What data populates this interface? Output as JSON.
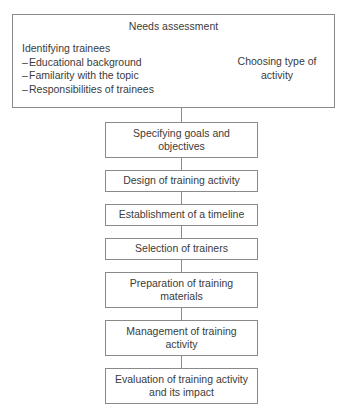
{
  "diagram": {
    "title": "Needs assessment",
    "header": {
      "title": "Needs assessment",
      "left_column": {
        "heading": "Identifying trainees",
        "items": [
          "Educational background",
          "Familarity with the topic",
          "Responsibilities of trainees"
        ],
        "bullet_marker": "–"
      },
      "right_column": {
        "text": "Choosing type of activity"
      }
    },
    "steps": [
      {
        "label": "Specifying goals and objectives",
        "lines": 2
      },
      {
        "label": "Design of training activity",
        "lines": 1
      },
      {
        "label": "Establishment of a timeline",
        "lines": 1
      },
      {
        "label": "Selection of trainers",
        "lines": 1
      },
      {
        "label": "Preparation of training materials",
        "lines": 2
      },
      {
        "label": "Management of training activity",
        "lines": 2
      },
      {
        "label": "Evaluation of training activity and its impact",
        "lines": 2
      }
    ],
    "colors": {
      "border": "#8a8a8a",
      "text": "#3b3b3b",
      "background": "#ffffff"
    }
  }
}
